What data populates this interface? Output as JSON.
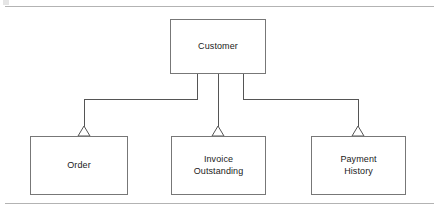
{
  "diagram": {
    "type": "uml-class-generalization",
    "title": "",
    "page_rules": {
      "top_rule_label": "top-separator",
      "bottom_rule_label": "bottom-separator",
      "color": "#b3b3b3"
    },
    "colors": {
      "box_border": "#777777",
      "box_fill": "#ffffff",
      "connector": "#555555",
      "text": "#1a1a1a",
      "rule": "#b3b3b3"
    },
    "superclass": {
      "id": "customer",
      "label": "Customer",
      "x": 170,
      "y": 19,
      "width": 96,
      "height": 55
    },
    "subclasses": [
      {
        "id": "order",
        "label": "Order",
        "x": 30,
        "y": 136,
        "width": 98,
        "height": 59
      },
      {
        "id": "invoice-outstanding",
        "label": "Invoice\nOutstanding",
        "x": 171,
        "y": 136,
        "width": 95,
        "height": 59
      },
      {
        "id": "payment-history",
        "label": "Payment\nHistory",
        "x": 311,
        "y": 136,
        "width": 95,
        "height": 59
      }
    ],
    "relationships": [
      {
        "kind": "generalization",
        "from": "order",
        "to": "customer",
        "arrowhead": "hollow-triangle",
        "routing": "orthogonal-elbow"
      },
      {
        "kind": "generalization",
        "from": "invoice-outstanding",
        "to": "customer",
        "arrowhead": "hollow-triangle",
        "routing": "straight-vertical"
      },
      {
        "kind": "generalization",
        "from": "payment-history",
        "to": "customer",
        "arrowhead": "hollow-triangle",
        "routing": "orthogonal-elbow"
      }
    ],
    "geometry": {
      "elbow_y": 99,
      "customer_bottom_y": 74,
      "arrow_tip_y": 127,
      "arrow_base_y": 136,
      "arrow_half_width": 6,
      "stub_left_x": 197,
      "stub_mid_x": 218,
      "stub_right_x": 243,
      "order_center_x": 84,
      "invoice_center_x": 218,
      "payment_center_x": 358
    }
  }
}
